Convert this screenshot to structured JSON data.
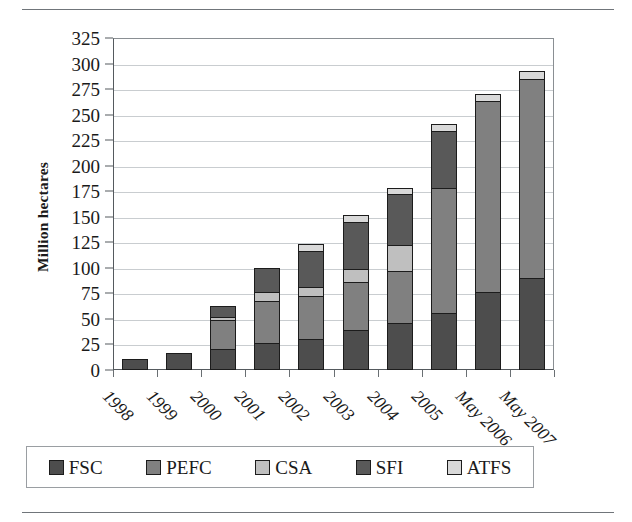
{
  "figure": {
    "y_axis_title": "Million hectares"
  },
  "chart_data": {
    "type": "bar",
    "stacked": true,
    "title": "",
    "xlabel": "",
    "ylabel": "Million hectares",
    "ylim": [
      0,
      325
    ],
    "ytick_step": 25,
    "yticks": [
      0,
      25,
      50,
      75,
      100,
      125,
      150,
      175,
      200,
      225,
      250,
      275,
      300,
      325
    ],
    "ytick_labels": [
      "0",
      "25",
      "50",
      "75",
      "100",
      "125",
      "150",
      "175",
      "200",
      "225",
      "250",
      "275",
      "300",
      "325"
    ],
    "grid": true,
    "grid_axis": "y",
    "legend_position": "bottom",
    "categories": [
      "1998",
      "1999",
      "2000",
      "2001",
      "2002",
      "2003",
      "2004",
      "2005",
      "May 2006",
      "May 2007"
    ],
    "series": [
      {
        "name": "FSC",
        "color": "#4d4d4d",
        "values": [
          11,
          17,
          19,
          25,
          29,
          38,
          45,
          54,
          75,
          89
        ]
      },
      {
        "name": "PEFC",
        "color": "#808080",
        "values": [
          0,
          0,
          30,
          42,
          43,
          47,
          51,
          124,
          188,
          196
        ]
      },
      {
        "name": "CSA",
        "color": "#bfbfbf",
        "values": [
          0,
          0,
          3,
          9,
          9,
          13,
          26,
          0,
          0,
          0
        ]
      },
      {
        "name": "SFI",
        "color": "#595959",
        "values": [
          0,
          0,
          11,
          24,
          35,
          47,
          50,
          56,
          0,
          0
        ]
      },
      {
        "name": "ATFS",
        "color": "#d9d9d9",
        "values": [
          0,
          0,
          0,
          0,
          7,
          7,
          6,
          7,
          7,
          8
        ]
      }
    ],
    "totals": [
      11,
      17,
      63,
      100,
      123,
      152,
      178,
      241,
      270,
      293
    ]
  },
  "legend": {
    "items": [
      {
        "label": "FSC",
        "color": "#4d4d4d"
      },
      {
        "label": "PEFC",
        "color": "#808080"
      },
      {
        "label": "CSA",
        "color": "#bfbfbf"
      },
      {
        "label": "SFI",
        "color": "#595959"
      },
      {
        "label": "ATFS",
        "color": "#d9d9d9"
      }
    ]
  }
}
